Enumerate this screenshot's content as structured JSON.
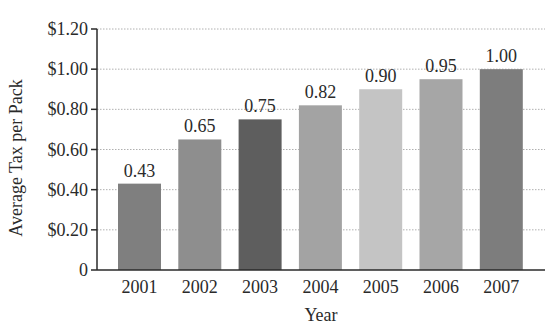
{
  "chart_data": {
    "type": "bar",
    "title": "",
    "xlabel": "Year",
    "ylabel": "Average Tax per Pack",
    "categories": [
      "2001",
      "2002",
      "2003",
      "2004",
      "2005",
      "2006",
      "2007"
    ],
    "values": [
      0.43,
      0.65,
      0.75,
      0.82,
      0.9,
      0.95,
      1.0
    ],
    "data_labels": [
      "0.43",
      "0.65",
      "0.75",
      "0.82",
      "0.90",
      "0.95",
      "1.00"
    ],
    "bar_colors": [
      "#7f7f7f",
      "#8e8e8e",
      "#5e5e5e",
      "#a3a3a3",
      "#c4c4c4",
      "#a6a6a6",
      "#7d7d7d"
    ],
    "ylim": [
      0,
      1.2
    ],
    "yticks": [
      0,
      0.2,
      0.4,
      0.6,
      0.8,
      1.0,
      1.2
    ],
    "ytick_labels": [
      "0",
      "$0.20",
      "$0.40",
      "$0.60",
      "$0.80",
      "$1.00",
      "$1.20"
    ],
    "grid": {
      "horizontal": true,
      "style": "dotted",
      "color": "#b0b0b0"
    },
    "legend": null
  }
}
